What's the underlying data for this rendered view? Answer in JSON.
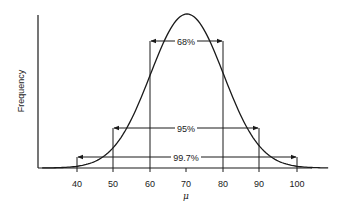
{
  "chart_data": {
    "type": "line",
    "title": "",
    "xlabel": "μ",
    "ylabel": "Frequency",
    "x_ticks": [
      40,
      50,
      60,
      70,
      80,
      90,
      100
    ],
    "x_tick_labels": [
      "40",
      "50",
      "60",
      "70",
      "80",
      "90",
      "100"
    ],
    "xlim": [
      30,
      110
    ],
    "grid": false,
    "legend": null,
    "series": [
      {
        "name": "Normal distribution (mean 70, sd 10)",
        "mean": 70,
        "sd": 10,
        "x": [
          30,
          40,
          50,
          60,
          70,
          80,
          90,
          100,
          110
        ],
        "values": [
          0.0003,
          0.0044,
          0.054,
          0.242,
          0.399,
          0.242,
          0.054,
          0.0044,
          0.0003
        ]
      }
    ],
    "annotations": [
      {
        "label": "68%",
        "from": 60,
        "to": 80
      },
      {
        "label": "95%",
        "from": 50,
        "to": 90
      },
      {
        "label": "99.7%",
        "from": 40,
        "to": 100
      }
    ]
  },
  "axes": {
    "ylabel": "Frequency",
    "xlabel": "μ",
    "ticks": [
      "40",
      "50",
      "60",
      "70",
      "80",
      "90",
      "100"
    ]
  },
  "intervals": {
    "one_sd": "68%",
    "two_sd": "95%",
    "three_sd": "99.7%"
  },
  "colors": {
    "line": "#1a1a1a",
    "background": "#ffffff"
  }
}
